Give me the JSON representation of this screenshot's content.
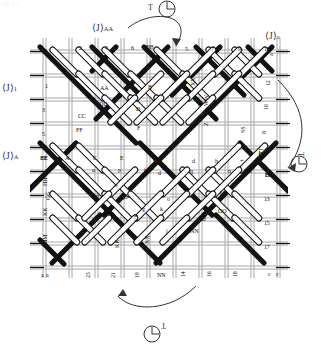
{
  "figure": {
    "title_faint": "Fig. 2-1"
  },
  "annotations": {
    "top_rotation": {
      "label": "T",
      "icon": "rotation-cw-icon"
    },
    "right_rotation": {
      "label": "T",
      "icon": "rotation-cw-icon"
    },
    "bottom_rotation": {
      "label": "T",
      "icon": "rotation-ccw-icon"
    },
    "angle_top_left": {
      "bracket": "⟨J⟩",
      "sub": "AA"
    },
    "angle_top_right": {
      "bracket": "⟨J⟩",
      "sub": "a"
    },
    "angle_left_upper": {
      "bracket": "⟨J⟩",
      "sub": "1"
    },
    "angle_left_lower": {
      "bracket": "⟨J⟩",
      "sub": "A"
    }
  },
  "edges": {
    "top": [
      "9",
      "2",
      "4",
      "6",
      "BB",
      "5",
      "7",
      "9",
      "11",
      "a"
    ],
    "left": [
      "9",
      "1",
      "3",
      "5",
      "EE",
      "HH",
      "KK",
      "MM",
      "PP",
      "a"
    ],
    "right": [
      "a",
      "12",
      "10",
      "8",
      "TT",
      "SS",
      "BB",
      "13",
      "15",
      "17",
      "c"
    ],
    "bottom": [
      "a",
      "23",
      "21",
      "19",
      "NN",
      "14",
      "16",
      "18",
      "c"
    ]
  },
  "interior": {
    "row_upper": [
      "AA",
      "DD",
      "CC",
      "FF",
      "B",
      "D",
      "F",
      "XX",
      "WW",
      "Z",
      "SS",
      "TT"
    ],
    "row_mid": [
      "EE",
      "A",
      "C",
      "E",
      "b",
      "d",
      "h",
      "+",
      "DD"
    ],
    "row_lower": [
      "GG",
      "JJ",
      "LL",
      "TT",
      "VV",
      "XX",
      "KK",
      "NN",
      "OO",
      "dd",
      "bb",
      "BB"
    ],
    "cells": [
      "*",
      "u",
      "p",
      "f",
      "d",
      "b",
      "o",
      "n",
      "q",
      "k",
      "j",
      "g",
      "e",
      "c"
    ]
  },
  "colors": {
    "ink": "#111111",
    "grid": "#9a9a9a",
    "fill_white": "#ffffff",
    "fill_black": "#121212",
    "paper": "#ffffff"
  }
}
